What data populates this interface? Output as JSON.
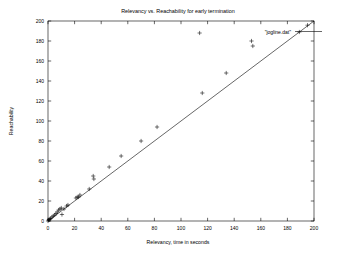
{
  "chart_data": {
    "type": "scatter",
    "title": "Relevancy vs. Reachability for early termination",
    "xlabel": "Relevancy, time in seconds",
    "ylabel": "Reachability",
    "xlim": [
      0,
      200
    ],
    "ylim": [
      0,
      200
    ],
    "xticks": [
      0,
      20,
      40,
      60,
      80,
      100,
      120,
      140,
      160,
      180,
      200
    ],
    "yticks": [
      0,
      20,
      40,
      60,
      80,
      100,
      120,
      140,
      160,
      180,
      200
    ],
    "xtick_labels": [
      "0",
      "20",
      "40",
      "60",
      "80",
      "100",
      "120",
      "140",
      "160",
      "180",
      "200"
    ],
    "ytick_labels": [
      "0",
      "20",
      "40",
      "60",
      "80",
      "100",
      "120",
      "140",
      "160",
      "180",
      "200"
    ],
    "grid": false,
    "legend_position": "top-right",
    "legend": [
      {
        "name": "\"jogline.dat\"",
        "marker": "plus",
        "color": "#000000"
      }
    ],
    "marker": "plus",
    "series": [
      {
        "name": "\"jogline.dat\"",
        "color": "#000000",
        "points": [
          [
            0,
            0
          ],
          [
            0.5,
            1
          ],
          [
            1,
            1.5
          ],
          [
            1.5,
            2
          ],
          [
            2,
            2.5
          ],
          [
            3,
            4
          ],
          [
            4,
            5
          ],
          [
            5,
            6
          ],
          [
            6,
            7.5
          ],
          [
            7,
            9
          ],
          [
            8,
            11
          ],
          [
            9,
            12
          ],
          [
            10,
            13
          ],
          [
            10.5,
            6.5
          ],
          [
            12,
            12
          ],
          [
            14,
            15
          ],
          [
            15,
            16
          ],
          [
            21,
            23
          ],
          [
            22,
            24
          ],
          [
            23,
            24
          ],
          [
            24,
            26
          ],
          [
            31,
            32
          ],
          [
            34,
            45
          ],
          [
            34.5,
            42
          ],
          [
            46,
            54
          ],
          [
            55,
            65
          ],
          [
            70,
            80
          ],
          [
            82,
            94
          ],
          [
            114,
            188
          ],
          [
            116,
            128
          ],
          [
            134,
            148
          ],
          [
            153,
            180
          ],
          [
            154,
            175
          ],
          [
            189,
            189
          ]
        ]
      }
    ],
    "reference_line": {
      "type": "identity",
      "from": [
        0,
        0
      ],
      "to": [
        200,
        200
      ],
      "color": "#000000"
    }
  }
}
